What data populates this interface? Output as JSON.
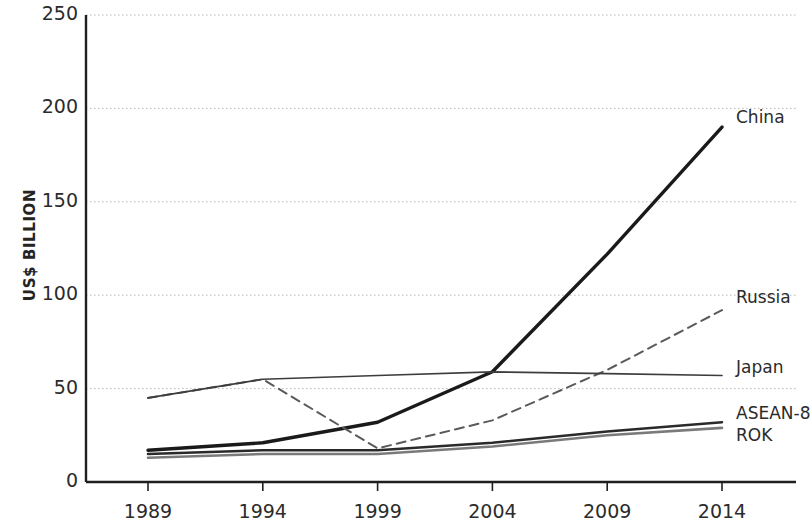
{
  "chart_data": {
    "type": "line",
    "title": "",
    "xlabel": "",
    "ylabel": "US$ BILLION",
    "categories": [
      "1989",
      "1994",
      "1999",
      "2004",
      "2009",
      "2014"
    ],
    "x": [
      1989,
      1994,
      1999,
      2004,
      2009,
      2014
    ],
    "xlim": [
      1989,
      2014
    ],
    "ylim": [
      0,
      250
    ],
    "y_ticks": [
      0,
      50,
      100,
      150,
      200,
      250
    ],
    "grid": "horizontal-dotted",
    "legend_position": "right-inline-end-labels",
    "series": [
      {
        "name": "China",
        "values": [
          17,
          21,
          32,
          59,
          122,
          190
        ],
        "color": "#1a1a1a",
        "style": "solid",
        "width": 3.4
      },
      {
        "name": "Russia",
        "values": [
          45,
          55,
          18,
          33,
          60,
          92
        ],
        "color": "#5a5a5a",
        "style": "dashed",
        "width": 2.0
      },
      {
        "name": "Japan",
        "values": [
          45,
          55,
          57,
          59,
          58,
          57
        ],
        "color": "#3d3d3d",
        "style": "solid",
        "width": 1.7
      },
      {
        "name": "ASEAN-8",
        "values": [
          15,
          17,
          17,
          21,
          27,
          32
        ],
        "color": "#2a2a2a",
        "style": "solid",
        "width": 2.6
      },
      {
        "name": "ROK",
        "values": [
          13,
          15,
          15,
          19,
          25,
          29
        ],
        "color": "#7a7a7a",
        "style": "solid",
        "width": 2.6
      }
    ]
  },
  "axis": {
    "y_title": "US$ BILLION",
    "y_labels": [
      "250",
      "200",
      "150",
      "100",
      "50",
      "0"
    ],
    "x_labels": [
      "1989",
      "1994",
      "1999",
      "2004",
      "2009",
      "2014"
    ]
  },
  "series_labels": {
    "china": "China",
    "russia": "Russia",
    "japan": "Japan",
    "asean": "ASEAN-8",
    "rok": "ROK"
  },
  "colors": {
    "axis": "#1f1f1f",
    "grid": "#b9b9b9",
    "text": "#2b2b2b",
    "china": "#1a1a1a",
    "russia": "#5a5a5a",
    "japan": "#3d3d3d",
    "asean": "#2a2a2a",
    "rok": "#7a7a7a"
  }
}
